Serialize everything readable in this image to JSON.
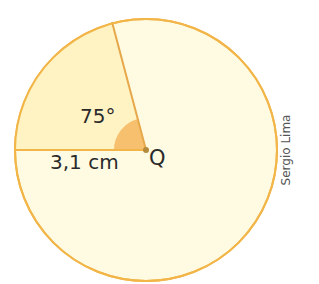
{
  "diagram": {
    "type": "circle-sector",
    "center_label": "Q",
    "angle_label": "75°",
    "radius_label": "3,1 cm",
    "angle_degrees": 75,
    "radius_cm": 3.1
  },
  "credit": "Sergio Lima",
  "colors": {
    "circle_fill": "#fffbe3",
    "sector_fill": "#fff3c4",
    "outline": "#f2b548",
    "angle_marker": "#f6c06e",
    "center_dot": "#b48a3c",
    "text": "#2a2a2a"
  }
}
